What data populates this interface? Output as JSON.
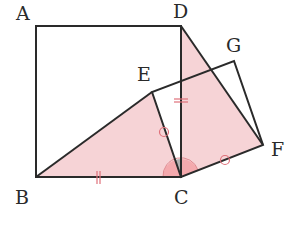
{
  "diagram": {
    "type": "geometry",
    "colors": {
      "stroke": "#2a2a2a",
      "shade": "#f6d3d6",
      "angle_fill": "#f4a9ad",
      "angle_gray": "#b0b0b0",
      "mark": "#e0707a"
    },
    "points": {
      "A": {
        "label": "A",
        "x": 36,
        "y": 26
      },
      "B": {
        "label": "B",
        "x": 36,
        "y": 177
      },
      "C": {
        "label": "C",
        "x": 181,
        "y": 177
      },
      "D": {
        "label": "D",
        "x": 181,
        "y": 26
      },
      "E": {
        "label": "E",
        "x": 152,
        "y": 92
      },
      "F": {
        "label": "F",
        "x": 263,
        "y": 145
      },
      "G": {
        "label": "G",
        "x": 234,
        "y": 61
      }
    },
    "shaded_triangles": [
      "BEC",
      "DCF"
    ],
    "marks": {
      "double_tick": [
        "BC",
        "DC"
      ],
      "circle": [
        "EC",
        "CF"
      ],
      "angle_arcs": [
        "BCE",
        "DCF"
      ],
      "gray_angle": "ECD"
    }
  }
}
